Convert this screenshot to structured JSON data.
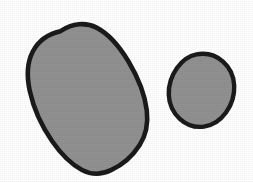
{
  "canvas": {
    "width": 253,
    "height": 182,
    "background_color": "#ffffff",
    "title": "Two shaded blobs"
  },
  "style": {
    "fill_color": "#919191",
    "outline_color": "#1a1a1a",
    "outline_width": 4.5,
    "fill_texture": "subtle-noise"
  },
  "shapes": [
    {
      "id": "large-blob",
      "name": "large-tilted-ellipse",
      "role": "filled-outlined-blob",
      "fill_color": "#919191",
      "outline_color": "#1a1a1a",
      "outline_width": 4.6,
      "bounds": {
        "x": 27,
        "y": 24,
        "width": 121,
        "height": 150
      },
      "center": {
        "x": 87,
        "y": 99
      },
      "approx_radius_x": 48,
      "approx_radius_y": 74,
      "rotation_deg": -28,
      "path": "M 60.5 31.2 C 72.5 23.0 86.0 22.2 96.5 27.6 C 109.0 34.0 119.5 46.5 128.5 61.5 C 138.5 78.2 145.0 95.5 146.8 110.5 C 148.4 124.0 145.8 135.5 139.5 145.2 C 132.5 156.0 122.0 165.0 111.0 170.2 C 101.0 175.0 91.0 174.8 82.0 170.0 C 71.5 164.4 61.0 154.0 52.0 141.0 C 41.5 125.8 33.5 108.0 29.8 91.0 C 26.4 75.5 27.2 62.2 32.8 51.5 C 38.5 40.6 48.5 33.8 60.5 31.2 Z"
    },
    {
      "id": "small-blob",
      "name": "small-round-blob",
      "role": "filled-outlined-blob",
      "fill_color": "#919191",
      "outline_color": "#1a1a1a",
      "outline_width": 4.4,
      "bounds": {
        "x": 170,
        "y": 52,
        "width": 66,
        "height": 76
      },
      "center": {
        "x": 203,
        "y": 90
      },
      "approx_radius_x": 31,
      "approx_radius_y": 36,
      "rotation_deg": 0,
      "path": "M 196.5 54.4 C 206.5 52.6 216.0 55.4 223.0 61.6 C 229.8 67.6 233.8 76.2 234.2 85.5 C 234.6 95.0 231.6 104.8 226.0 112.5 C 220.4 120.2 212.4 125.4 204.0 126.6 C 195.4 127.8 186.4 124.8 179.8 118.8 C 173.2 112.8 169.2 104.2 168.8 95.0 C 168.4 85.6 171.4 75.8 177.0 68.0 C 182.2 60.8 189.0 55.8 196.5 54.4 Z"
    }
  ]
}
